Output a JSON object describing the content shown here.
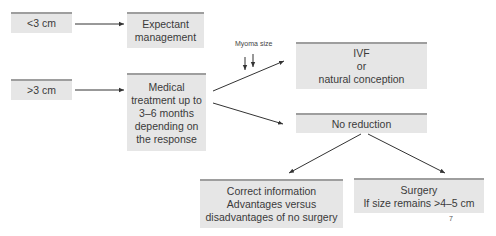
{
  "diagram": {
    "boxes": {
      "small": {
        "lines": [
          "<3 cm"
        ]
      },
      "large": {
        "lines": [
          ">3 cm"
        ]
      },
      "expectant": {
        "lines": [
          "Expectant",
          "management"
        ]
      },
      "medical": {
        "lines": [
          "Medical",
          "treatment up to",
          "3–6 months",
          "depending on",
          "the response"
        ]
      },
      "ivf": {
        "lines": [
          "IVF",
          "or",
          "natural conception"
        ]
      },
      "no_reduction": {
        "lines": [
          "No reduction"
        ]
      },
      "correct_info": {
        "lines": [
          "Correct information",
          "Advantages versus",
          "disadvantages of no surgery"
        ]
      },
      "surgery": {
        "lines": [
          "Surgery",
          "If size remains >4–5 cm"
        ]
      }
    },
    "annotation": {
      "label": "Myoma size",
      "arrows": "↓↓"
    },
    "page_number": "7",
    "colors": {
      "box_fill": "#e6e6e6",
      "box_top_border": "#9e9e9e",
      "connector": "#333333"
    }
  }
}
